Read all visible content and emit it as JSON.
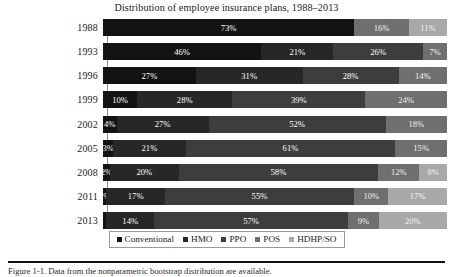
{
  "chart_data": {
    "type": "bar",
    "subtype": "stacked-horizontal-100pct",
    "title": "Distribution of employee insurance plans, 1988–2013",
    "xlabel": "",
    "ylabel": "",
    "xlim": [
      0,
      100
    ],
    "grid": false,
    "legend_position": "bottom-center",
    "categories": [
      "1988",
      "1993",
      "1996",
      "1999",
      "2002",
      "2005",
      "2008",
      "2011",
      "2013"
    ],
    "series": [
      {
        "name": "Conventional",
        "color": "#131313",
        "values": [
          73,
          46,
          27,
          10,
          4,
          3,
          2,
          1,
          1
        ],
        "labels": [
          "73%",
          "46%",
          "27%",
          "10%",
          "4%",
          "3%",
          "2%",
          "1%",
          ""
        ]
      },
      {
        "name": "HMO",
        "color": "#272727",
        "values": [
          0,
          21,
          31,
          28,
          27,
          21,
          20,
          17,
          14
        ],
        "labels": [
          "",
          "21%",
          "31%",
          "28%",
          "27%",
          "21%",
          "20%",
          "17%",
          "14%"
        ]
      },
      {
        "name": "PPO",
        "color": "#3d3d3d",
        "values": [
          0,
          26,
          28,
          39,
          52,
          61,
          58,
          55,
          57
        ],
        "labels": [
          "",
          "26%",
          "28%",
          "39%",
          "52%",
          "61%",
          "58%",
          "55%",
          "57%"
        ]
      },
      {
        "name": "POS",
        "color": "#6f6f6f",
        "values": [
          16,
          7,
          14,
          24,
          18,
          15,
          12,
          10,
          9
        ],
        "labels": [
          "16%",
          "7%",
          "14%",
          "24%",
          "18%",
          "15%",
          "12%",
          "10%",
          "9%"
        ]
      },
      {
        "name": "HDHP/SO",
        "color": "#a8a8a8",
        "values": [
          11,
          0,
          0,
          0,
          0,
          0,
          8,
          17,
          20
        ],
        "labels": [
          "11%",
          "",
          "",
          "",
          "",
          "",
          "8%",
          "17%",
          "20%"
        ]
      }
    ]
  },
  "legend": {
    "items": [
      {
        "label": "Conventional",
        "color": "#131313"
      },
      {
        "label": "HMO",
        "color": "#272727"
      },
      {
        "label": "PPO",
        "color": "#3d3d3d"
      },
      {
        "label": "POS",
        "color": "#6f6f6f"
      },
      {
        "label": "HDHP/SO",
        "color": "#a8a8a8"
      }
    ]
  },
  "caption": {
    "text": "Figure 1-1.  Data from the nonparametric bootstrap distribution are available."
  }
}
